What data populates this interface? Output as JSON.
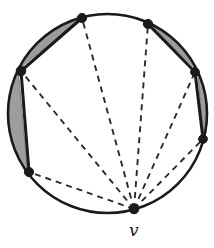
{
  "figure": {
    "type": "geometric-diagram",
    "canvas": {
      "width": 214,
      "height": 248
    },
    "colors": {
      "stroke": "#1a1a1a",
      "shading": "#9d9d9d",
      "shading_edge": "#6f6f6f",
      "background": "#ffffff",
      "dashed": "#2b2b2b"
    },
    "circle": {
      "center_x": 107.5,
      "center_y": 113.5,
      "radius": 99.5,
      "stroke_width": 2.6
    },
    "vertices": [
      {
        "id": "p1",
        "label": "",
        "x": 82,
        "y": 18,
        "radius": 4.6
      },
      {
        "id": "p2",
        "label": "",
        "x": 148,
        "y": 24,
        "radius": 4.6
      },
      {
        "id": "p3",
        "label": "",
        "x": 195,
        "y": 72,
        "radius": 4.4
      },
      {
        "id": "p4",
        "label": "",
        "x": 203,
        "y": 139,
        "radius": 4.4
      },
      {
        "id": "v",
        "label": "v",
        "x": 134,
        "y": 209,
        "radius": 4.8
      },
      {
        "id": "p6",
        "label": "",
        "x": 29,
        "y": 172,
        "radius": 4.6
      },
      {
        "id": "p7",
        "label": "",
        "x": 21,
        "y": 71,
        "radius": 4.8
      }
    ],
    "labels": [
      {
        "id": "label-v",
        "text": "v",
        "x": 129,
        "y": 222,
        "for": "v"
      }
    ],
    "solid_edges": [
      {
        "from": "p7",
        "to": "p1",
        "width": 3.0
      },
      {
        "from": "p2",
        "to": "p3",
        "width": 3.0
      },
      {
        "from": "p3",
        "to": "p4",
        "width": 3.0
      },
      {
        "from": "p7",
        "to": "p6",
        "width": 3.0
      }
    ],
    "solid_arcs": [
      {
        "from": "p1",
        "to": "p2",
        "note": "top arc of circle"
      },
      {
        "from": "p4",
        "to": "v",
        "note": "lower-right arc of circle"
      },
      {
        "from": "v",
        "to": "p6",
        "note": "lower-left arc of circle"
      }
    ],
    "shaded_segments": [
      {
        "from": "p7",
        "to": "p1",
        "note": "upper-left lens between chord and arc"
      },
      {
        "from": "p2",
        "to": "p3",
        "note": "upper-right lens between chord and arc"
      },
      {
        "from": "p3",
        "to": "p4",
        "note": "right lens between chord and arc"
      },
      {
        "from": "p7",
        "to": "p6",
        "note": "left lens between chord and arc"
      }
    ],
    "dashed_edges": [
      {
        "from": "v",
        "to": "p1",
        "note": "fan chord to top-left vertex"
      },
      {
        "from": "v",
        "to": "p2",
        "note": "fan chord to top-right vertex"
      },
      {
        "from": "v",
        "to": "p3",
        "note": "fan chord to right vertex"
      },
      {
        "from": "v",
        "to": "p4",
        "note": "fan chord to lower-right vertex"
      },
      {
        "from": "v",
        "to": "p6",
        "note": "fan chord to lower-left vertex"
      },
      {
        "from": "v",
        "to": "p7",
        "note": "fan chord to left vertex"
      },
      {
        "from": "p7",
        "to": "p6",
        "note": "short dashed segment inside left region"
      }
    ],
    "dash_pattern": "6 5"
  }
}
